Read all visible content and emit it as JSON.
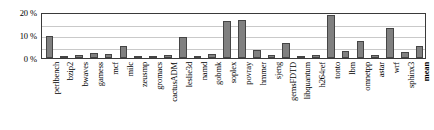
{
  "chart_data": {
    "type": "bar",
    "title": "",
    "subtitle": "",
    "xlabel": "",
    "ylabel": "",
    "ylim": [
      0,
      20
    ],
    "ytick_labels": [
      "0 %",
      "10 %",
      "20 %"
    ],
    "ytick_values": [
      0,
      10,
      20
    ],
    "grid": true,
    "legend": null,
    "bar_color": "#808080",
    "bar_edge_color": "#454545",
    "axis_color": "#3a3a3a",
    "grid_color": "#c9c9c9",
    "categories": [
      "perlbench",
      "bzip2",
      "bwaves",
      "gamess",
      "mcf",
      "milc",
      "zeusmp",
      "gromacs",
      "cactusADM",
      "leslie3d",
      "namd",
      "gobmk",
      "soplex",
      "povray",
      "hmmer",
      "sjeng",
      "gemsFDTD",
      "libquantum",
      "h264ref",
      "tonto",
      "lbm",
      "omnetpp",
      "astar",
      "wrf",
      "sphinx3",
      "mean"
    ],
    "values": [
      9.6,
      0.8,
      1.5,
      2.2,
      1.7,
      5.4,
      0.6,
      0.4,
      1.1,
      9.1,
      0.7,
      1.9,
      16.2,
      16.4,
      3.3,
      1.4,
      6.4,
      0.9,
      1.2,
      18.6,
      3.1,
      7.2,
      1.2,
      12.9,
      2.4,
      5.2
    ],
    "bold_categories": [
      "mean"
    ]
  }
}
